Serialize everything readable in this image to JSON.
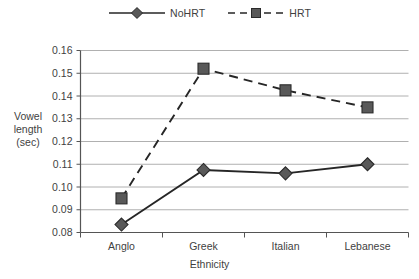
{
  "chart_data": {
    "type": "line",
    "title": "",
    "xlabel": "Ethnicity",
    "ylabel": "Vowel length (sec)",
    "categories": [
      "Anglo",
      "Greek",
      "Italian",
      "Lebanese"
    ],
    "ylim": [
      0.08,
      0.16
    ],
    "ytick_step": 0.01,
    "ytick_labels": [
      "0.16",
      "0.15",
      "0.14",
      "0.13",
      "0.12",
      "0.11",
      "0.10",
      "0.09",
      "0.08"
    ],
    "ytick_values": [
      0.16,
      0.15,
      0.14,
      0.13,
      0.12,
      0.11,
      0.1,
      0.09,
      0.08
    ],
    "grid": true,
    "legend_position": "top-center",
    "series": [
      {
        "name": "NoHRT",
        "marker": "diamond",
        "line_style": "solid",
        "color": "#595959",
        "values": [
          0.0835,
          0.1075,
          0.106,
          0.11
        ]
      },
      {
        "name": "HRT",
        "marker": "square",
        "line_style": "dashed",
        "color": "#595959",
        "values": [
          0.095,
          0.152,
          0.1425,
          0.135
        ]
      }
    ]
  },
  "legend": {
    "entries": [
      {
        "label": "NoHRT",
        "marker": "diamond-marker",
        "style": "solid-line"
      },
      {
        "label": "HRT",
        "marker": "square-marker",
        "style": "dashed-line"
      }
    ]
  },
  "axes": {
    "y_title_lines": [
      "Vowel",
      "length",
      "(sec)"
    ],
    "x_title": "Ethnicity"
  },
  "colors": {
    "marker_fill": "#595959",
    "marker_stroke": "#2b2b2b",
    "series_line": "#262626",
    "grid": "#b0b0b0",
    "axis": "#555555",
    "text": "#3f3f3f",
    "background": "#ffffff"
  }
}
